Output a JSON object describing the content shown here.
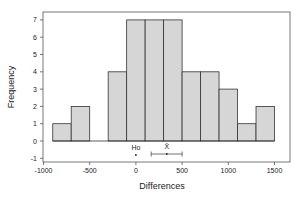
{
  "chart_data": {
    "type": "bar",
    "title": "",
    "xlabel": "Differences",
    "ylabel": "Frequency",
    "bin_width": 200,
    "bin_edges": [
      -900,
      -700,
      -500,
      -300,
      -100,
      100,
      300,
      500,
      700,
      900,
      1100,
      1300,
      1500
    ],
    "values": [
      1,
      2,
      0,
      4,
      7,
      7,
      7,
      4,
      4,
      3,
      1,
      2
    ],
    "xlim": [
      -1000,
      1500
    ],
    "ylim": [
      -1,
      7
    ],
    "x_ticks": [
      "-1000",
      "-500",
      "0",
      "500",
      "1000",
      "1500"
    ],
    "y_ticks": [
      "-1",
      "0",
      "1",
      "2",
      "3",
      "4",
      "5",
      "6",
      "7"
    ],
    "grid": false,
    "annotations": {
      "h0_label": "Ho",
      "h0_value": 0,
      "xbar_label": "X̄",
      "xbar_mean": 335,
      "xbar_ci": [
        165,
        500
      ]
    },
    "colors": {
      "bar_fill": "#d6d6d6",
      "bar_edge": "#333333"
    }
  }
}
